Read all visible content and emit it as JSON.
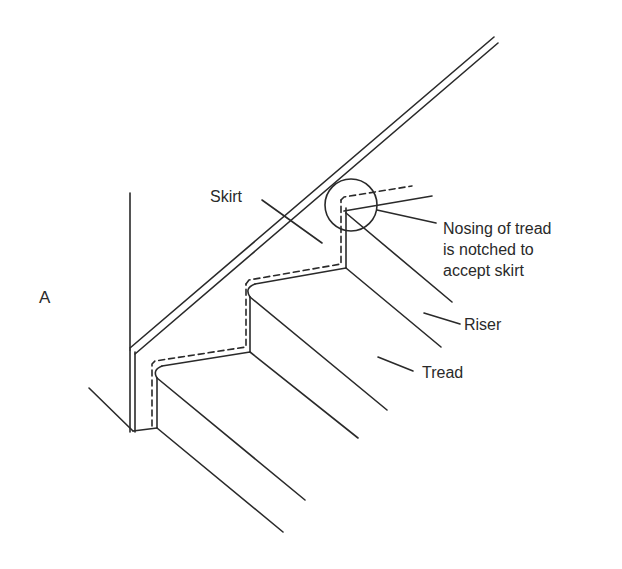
{
  "figure": {
    "letter": "A",
    "stroke_color": "#2a2a2a",
    "background": "#ffffff"
  },
  "labels": {
    "skirt": "Skirt",
    "nosing_line1": "Nosing of tread",
    "nosing_line2": "is notched to",
    "nosing_line3": "accept skirt",
    "riser": "Riser",
    "tread": "Tread"
  }
}
